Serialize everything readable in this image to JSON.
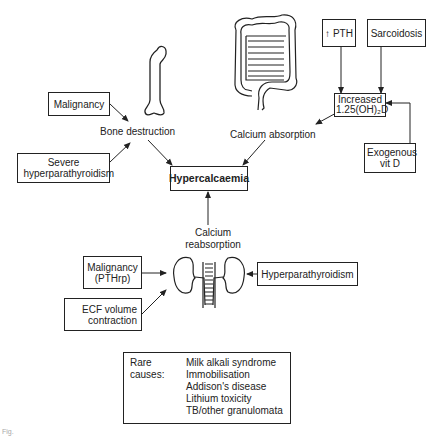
{
  "center": "Hypercalcaemia",
  "bone": {
    "label": "Bone destruction",
    "causes": [
      "Malignancy",
      "Severe hyperparathyroidism"
    ]
  },
  "gut": {
    "label": "Calcium absorption",
    "mediator": "Increased 1.25(OH)₂D",
    "causes": [
      "↑ PTH",
      "Sarcoidosis",
      "Exogenous vit D"
    ]
  },
  "kidney": {
    "label": "Calcium reabsorption",
    "causes": [
      "Malignancy (PTHrp)",
      "ECF volume contraction",
      "Hyperparathyroidism"
    ]
  },
  "rare": {
    "heading": "Rare causes:",
    "items": [
      "Milk alkali syndrome",
      "Immobilisation",
      "Addison's disease",
      "Lithium toxicity",
      "TB/other granulomata"
    ]
  },
  "caption": "Fig."
}
